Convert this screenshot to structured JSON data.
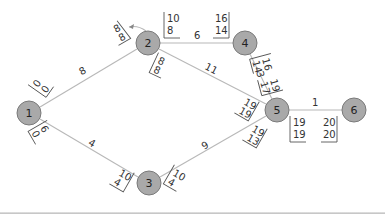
{
  "diagram": {
    "type": "activity-on-arrow network (CPM)",
    "nodes": [
      {
        "id": "1",
        "label": "1",
        "x": 29,
        "y": 113
      },
      {
        "id": "2",
        "label": "2",
        "x": 148,
        "y": 43
      },
      {
        "id": "3",
        "label": "3",
        "x": 149,
        "y": 183
      },
      {
        "id": "4",
        "label": "4",
        "x": 245,
        "y": 43
      },
      {
        "id": "5",
        "label": "5",
        "x": 277,
        "y": 110
      },
      {
        "id": "6",
        "label": "6",
        "x": 354,
        "y": 110
      }
    ],
    "edges": [
      {
        "from": "1",
        "to": "2",
        "duration": "8"
      },
      {
        "from": "1",
        "to": "3",
        "duration": "4"
      },
      {
        "from": "2",
        "to": "4",
        "duration": "6"
      },
      {
        "from": "2",
        "to": "5",
        "duration": "11"
      },
      {
        "from": "4",
        "to": "5",
        "duration": "3"
      },
      {
        "from": "3",
        "to": "5",
        "duration": "9"
      },
      {
        "from": "5",
        "to": "6",
        "duration": "1"
      }
    ],
    "time_boxes": [
      {
        "near": "1-2 start",
        "top": "0",
        "bottom": "0"
      },
      {
        "near": "1-2 end",
        "top": "8",
        "bottom": "8"
      },
      {
        "near": "1-3 start",
        "top": "6",
        "bottom": "0"
      },
      {
        "near": "1-3 end",
        "top": "10",
        "bottom": "4"
      },
      {
        "near": "2-4 start",
        "top": "10",
        "bottom": "8"
      },
      {
        "near": "2-4 end",
        "top": "16",
        "bottom": "14"
      },
      {
        "near": "2-5 start",
        "top": "8",
        "bottom": "8"
      },
      {
        "near": "2-5 end",
        "top": "19",
        "bottom": "19"
      },
      {
        "near": "4-5 start",
        "top": "16",
        "bottom": "14"
      },
      {
        "near": "4-5 end",
        "top": "19",
        "bottom": "17"
      },
      {
        "near": "3-5 start",
        "top": "10",
        "bottom": "4"
      },
      {
        "near": "3-5 end",
        "top": "19",
        "bottom": "13"
      },
      {
        "near": "5-6 start",
        "top": "19",
        "bottom": "19"
      },
      {
        "near": "5-6 end",
        "top": "20",
        "bottom": "20"
      }
    ]
  }
}
